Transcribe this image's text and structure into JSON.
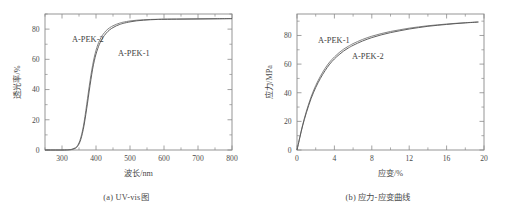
{
  "figure": {
    "panels": [
      {
        "id": "panel-a",
        "caption": "(a) UV-vis图",
        "series_labels": [
          "A-PEK-2",
          "A-PEK-1"
        ]
      },
      {
        "id": "panel-b",
        "caption": "(b) 应力-应变曲线",
        "series_labels": [
          "A-PEK-1",
          "A-PEK-2"
        ]
      }
    ]
  },
  "chart_data": [
    {
      "type": "line",
      "title": "",
      "caption": "(a) UV-vis图",
      "xlabel": "波长/nm",
      "ylabel": "透光率/%",
      "xlim": [
        250,
        800
      ],
      "ylim": [
        0,
        90
      ],
      "xticks": [
        300,
        400,
        500,
        600,
        700,
        800
      ],
      "yticks": [
        0,
        20,
        40,
        60,
        80
      ],
      "xtick_labels": [
        "300",
        "400",
        "500",
        "600",
        "700",
        "800"
      ],
      "ytick_labels": [
        "0",
        "20",
        "40",
        "60",
        "80"
      ],
      "minor_ticks": true,
      "grid": false,
      "legend": "inline-annotation",
      "series": [
        {
          "name": "A-PEK-2",
          "label_position": "upper-left",
          "x": [
            250,
            300,
            320,
            330,
            340,
            345,
            350,
            355,
            360,
            365,
            370,
            375,
            380,
            385,
            390,
            395,
            400,
            405,
            410,
            415,
            420,
            430,
            440,
            450,
            460,
            470,
            480,
            500,
            520,
            540,
            560,
            580,
            600,
            650,
            700,
            750,
            800
          ],
          "y": [
            0,
            0,
            0.2,
            0.6,
            1.6,
            2.8,
            4.8,
            8.0,
            12.5,
            18.5,
            26.0,
            34.0,
            42.0,
            49.5,
            56.0,
            61.5,
            66.0,
            69.5,
            72.3,
            74.5,
            76.3,
            79.0,
            80.9,
            82.2,
            83.2,
            84.0,
            84.6,
            85.4,
            85.9,
            86.2,
            86.4,
            86.5,
            86.6,
            86.7,
            86.8,
            86.9,
            87.0
          ]
        },
        {
          "name": "A-PEK-1",
          "label_position": "middle-right",
          "x": [
            250,
            300,
            320,
            330,
            340,
            345,
            350,
            355,
            360,
            365,
            370,
            375,
            380,
            385,
            390,
            395,
            400,
            405,
            410,
            415,
            420,
            430,
            440,
            450,
            460,
            470,
            480,
            500,
            520,
            540,
            560,
            580,
            600,
            650,
            700,
            750,
            800
          ],
          "y": [
            0,
            0,
            0.1,
            0.4,
            1.2,
            2.2,
            4.0,
            6.8,
            11.0,
            16.5,
            23.5,
            31.0,
            39.0,
            46.5,
            53.5,
            59.0,
            63.5,
            67.0,
            70.0,
            72.3,
            74.3,
            77.3,
            79.5,
            81.0,
            82.2,
            83.1,
            83.8,
            84.8,
            85.5,
            85.9,
            86.2,
            86.4,
            86.5,
            86.6,
            86.7,
            86.8,
            86.9
          ]
        }
      ]
    },
    {
      "type": "line",
      "title": "",
      "caption": "(b) 应力-应变曲线",
      "xlabel": "应变/%",
      "ylabel": "应力/MPa",
      "xlim": [
        0,
        20
      ],
      "ylim": [
        0,
        95
      ],
      "xticks": [
        0,
        4,
        8,
        12,
        16,
        20
      ],
      "yticks": [
        0,
        20,
        40,
        60,
        80
      ],
      "xtick_labels": [
        "0",
        "4",
        "8",
        "12",
        "16",
        "20"
      ],
      "ytick_labels": [
        "0",
        "20",
        "40",
        "60",
        "80"
      ],
      "minor_ticks": true,
      "grid": false,
      "legend": "inline-annotation",
      "series": [
        {
          "name": "A-PEK-1",
          "label_position": "upper-left",
          "x": [
            0,
            0.3,
            0.6,
            1.0,
            1.5,
            2.0,
            2.5,
            3.0,
            3.5,
            4.0,
            4.5,
            5.0,
            5.5,
            6.0,
            7.0,
            8.0,
            9.0,
            10.0,
            11.0,
            12.0,
            13.0,
            14.0,
            15.0,
            16.0,
            17.0,
            18.0,
            19.0,
            19.4
          ],
          "y": [
            0,
            9.0,
            17.5,
            27.0,
            37.0,
            45.0,
            51.5,
            57.0,
            61.5,
            65.0,
            68.0,
            70.5,
            72.5,
            74.3,
            77.2,
            79.5,
            81.3,
            82.8,
            84.0,
            85.1,
            86.0,
            86.8,
            87.4,
            88.0,
            88.5,
            88.9,
            89.3,
            89.4
          ]
        },
        {
          "name": "A-PEK-2",
          "label_position": "middle-right",
          "x": [
            0,
            0.3,
            0.6,
            1.0,
            1.5,
            2.0,
            2.5,
            3.0,
            3.5,
            4.0,
            4.5,
            5.0,
            5.5,
            6.0,
            7.0,
            8.0,
            9.0,
            10.0,
            11.0,
            12.0,
            13.0,
            14.0,
            15.0,
            16.0,
            17.0,
            18.0,
            19.0,
            19.4
          ],
          "y": [
            0,
            8.6,
            16.8,
            26.0,
            35.8,
            43.6,
            50.0,
            55.4,
            60.0,
            63.6,
            66.6,
            69.2,
            71.3,
            73.1,
            76.1,
            78.5,
            80.4,
            82.0,
            83.3,
            84.5,
            85.5,
            86.4,
            87.1,
            87.7,
            88.3,
            88.8,
            89.2,
            89.4
          ]
        }
      ]
    }
  ],
  "colors": {
    "curve_primary": "#595959",
    "curve_secondary": "#7d7d7d",
    "axis": "#8a8a8a",
    "text": "#4a4a4a",
    "background": "#ffffff"
  }
}
